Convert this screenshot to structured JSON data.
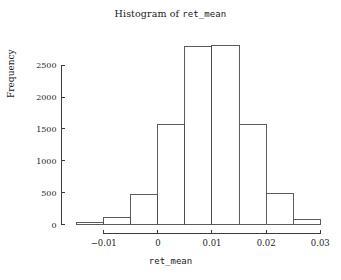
{
  "chart_data": {
    "type": "bar",
    "title": "Histogram of ret_mean",
    "title_prefix": "Histogram of ",
    "title_variable": "ret_mean",
    "xlabel": "ret_mean",
    "ylabel": "Frequency",
    "grid": false,
    "legend": "none",
    "xlim": [
      -0.0165,
      0.0305
    ],
    "ylim": [
      0,
      2880
    ],
    "bin_width": 0.005,
    "bin_edges": [
      -0.015,
      -0.01,
      -0.005,
      0.0,
      0.005,
      0.01,
      0.015,
      0.02,
      0.025
    ],
    "categories": [
      "-0.015 to -0.010",
      "-0.010 to -0.005",
      "-0.005 to 0.000",
      "0.000 to 0.005",
      "0.005 to 0.010",
      "0.010 to 0.015",
      "0.015 to 0.020",
      "0.020 to 0.025"
    ],
    "values": [
      30,
      110,
      470,
      1575,
      2795,
      2810,
      1575,
      490
    ],
    "bars": [
      {
        "x0": -0.015,
        "x1": -0.01,
        "frequency": 30
      },
      {
        "x0": -0.01,
        "x1": -0.005,
        "frequency": 110
      },
      {
        "x0": -0.005,
        "x1": 0.0,
        "frequency": 470
      },
      {
        "x0": 0.0,
        "x1": 0.005,
        "frequency": 1575
      },
      {
        "x0": 0.005,
        "x1": 0.01,
        "frequency": 2795
      },
      {
        "x0": 0.01,
        "x1": 0.015,
        "frequency": 2810
      },
      {
        "x0": 0.015,
        "x1": 0.02,
        "frequency": 1575
      },
      {
        "x0": 0.02,
        "x1": 0.025,
        "frequency": 490
      },
      {
        "x0": 0.025,
        "x1": 0.03,
        "frequency": 80
      }
    ],
    "xticks": [
      -0.01,
      0,
      0.01,
      0.02,
      0.03
    ],
    "xticklabels": [
      "-0.01",
      "0",
      "0.01",
      "0.02",
      "0.03"
    ],
    "yticks": [
      0,
      500,
      1000,
      1500,
      2000,
      2500
    ],
    "yticklabels": [
      "0",
      "500",
      "1000",
      "1500",
      "2000",
      "2500"
    ],
    "colors": {
      "background": "#ffffff",
      "bar_fill": "#ffffff",
      "bar_stroke": "#4a4a4a",
      "axis": "#3c3c3c",
      "text": "#1a1a1a"
    }
  }
}
